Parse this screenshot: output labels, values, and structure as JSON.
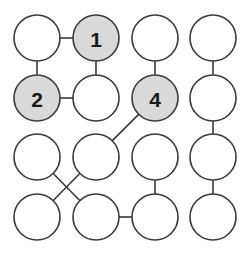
{
  "diagram": {
    "type": "node-link-graph",
    "canvas": {
      "width": 250,
      "height": 263,
      "background": "#ffffff"
    },
    "style": {
      "node_radius": 23,
      "node_fill_plain": "#ffffff",
      "node_fill_shaded": "#d9d9d9",
      "node_stroke": "#3a3a3a",
      "node_stroke_width": 1.6,
      "edge_stroke": "#3a3a3a",
      "edge_stroke_width": 1.6,
      "label_color": "#1a1a1a",
      "label_font_size": 21
    },
    "grid": {
      "columns": 4,
      "rows": 4,
      "column_centers_x": [
        37,
        96,
        155,
        213
      ],
      "row_centers_y": [
        38,
        98,
        157,
        217
      ]
    },
    "nodes": [
      {
        "id": "r1c1",
        "row": 1,
        "col": 1,
        "cx": 37,
        "cy": 38,
        "r": 23,
        "shaded": false,
        "label": ""
      },
      {
        "id": "r1c2",
        "row": 1,
        "col": 2,
        "cx": 96,
        "cy": 38,
        "r": 23,
        "shaded": true,
        "label": "1"
      },
      {
        "id": "r1c3",
        "row": 1,
        "col": 3,
        "cx": 155,
        "cy": 38,
        "r": 23,
        "shaded": false,
        "label": ""
      },
      {
        "id": "r1c4",
        "row": 1,
        "col": 4,
        "cx": 213,
        "cy": 38,
        "r": 23,
        "shaded": false,
        "label": ""
      },
      {
        "id": "r2c1",
        "row": 2,
        "col": 1,
        "cx": 37,
        "cy": 98,
        "r": 23,
        "shaded": true,
        "label": "2"
      },
      {
        "id": "r2c2",
        "row": 2,
        "col": 2,
        "cx": 96,
        "cy": 98,
        "r": 23,
        "shaded": false,
        "label": ""
      },
      {
        "id": "r2c3",
        "row": 2,
        "col": 3,
        "cx": 155,
        "cy": 98,
        "r": 23,
        "shaded": true,
        "label": "4"
      },
      {
        "id": "r2c4",
        "row": 2,
        "col": 4,
        "cx": 213,
        "cy": 98,
        "r": 23,
        "shaded": false,
        "label": ""
      },
      {
        "id": "r3c1",
        "row": 3,
        "col": 1,
        "cx": 37,
        "cy": 157,
        "r": 23,
        "shaded": false,
        "label": ""
      },
      {
        "id": "r3c2",
        "row": 3,
        "col": 2,
        "cx": 96,
        "cy": 157,
        "r": 23,
        "shaded": false,
        "label": ""
      },
      {
        "id": "r3c3",
        "row": 3,
        "col": 3,
        "cx": 155,
        "cy": 157,
        "r": 23,
        "shaded": false,
        "label": ""
      },
      {
        "id": "r3c4",
        "row": 3,
        "col": 4,
        "cx": 213,
        "cy": 157,
        "r": 23,
        "shaded": false,
        "label": ""
      },
      {
        "id": "r4c1",
        "row": 4,
        "col": 1,
        "cx": 37,
        "cy": 217,
        "r": 23,
        "shaded": false,
        "label": ""
      },
      {
        "id": "r4c2",
        "row": 4,
        "col": 2,
        "cx": 96,
        "cy": 217,
        "r": 23,
        "shaded": false,
        "label": ""
      },
      {
        "id": "r4c3",
        "row": 4,
        "col": 3,
        "cx": 155,
        "cy": 217,
        "r": 23,
        "shaded": false,
        "label": ""
      },
      {
        "id": "r4c4",
        "row": 4,
        "col": 4,
        "cx": 213,
        "cy": 217,
        "r": 23,
        "shaded": false,
        "label": ""
      }
    ],
    "edges": [
      {
        "id": "e1",
        "from": "r1c1",
        "to": "r1c2",
        "kind": "horizontal"
      },
      {
        "id": "e2",
        "from": "r1c1",
        "to": "r2c1",
        "kind": "vertical"
      },
      {
        "id": "e3",
        "from": "r1c2",
        "to": "r2c2",
        "kind": "vertical"
      },
      {
        "id": "e4",
        "from": "r2c1",
        "to": "r2c2",
        "kind": "horizontal"
      },
      {
        "id": "e5",
        "from": "r1c3",
        "to": "r2c3",
        "kind": "vertical"
      },
      {
        "id": "e6",
        "from": "r1c4",
        "to": "r2c4",
        "kind": "vertical"
      },
      {
        "id": "e7",
        "from": "r2c4",
        "to": "r3c4",
        "kind": "vertical"
      },
      {
        "id": "e8",
        "from": "r3c4",
        "to": "r4c4",
        "kind": "vertical"
      },
      {
        "id": "e9",
        "from": "r2c3",
        "to": "r3c2",
        "kind": "diagonal"
      },
      {
        "id": "e10",
        "from": "r3c1",
        "to": "r4c2",
        "kind": "diagonal"
      },
      {
        "id": "e11",
        "from": "r3c2",
        "to": "r4c1",
        "kind": "diagonal"
      },
      {
        "id": "e12",
        "from": "r4c2",
        "to": "r4c3",
        "kind": "horizontal"
      },
      {
        "id": "e13",
        "from": "r3c3",
        "to": "r4c3",
        "kind": "vertical"
      }
    ],
    "labels": [
      {
        "node": "r1c2",
        "text": "1"
      },
      {
        "node": "r2c1",
        "text": "2"
      },
      {
        "node": "r2c3",
        "text": "4"
      }
    ]
  }
}
